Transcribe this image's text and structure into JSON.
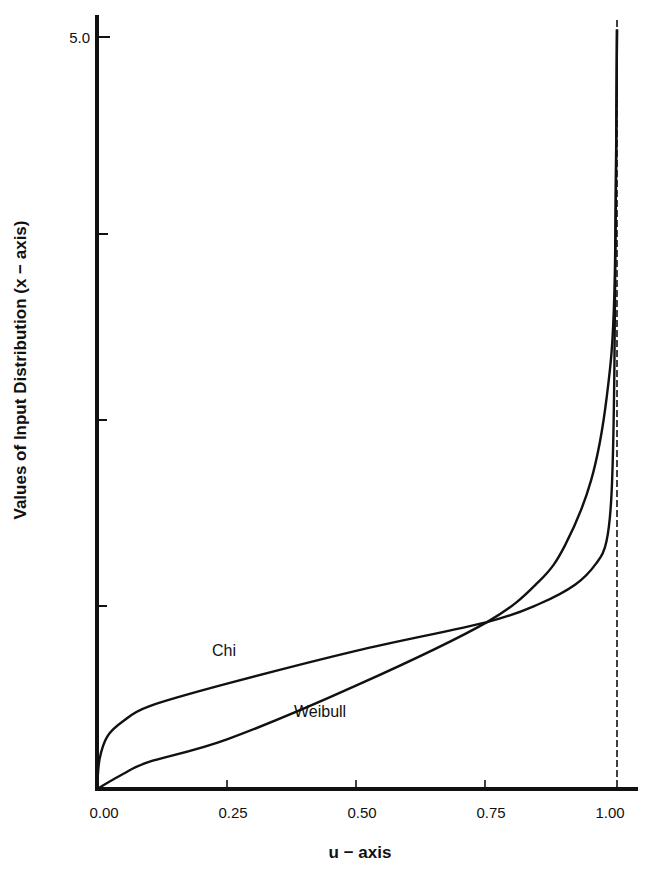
{
  "chart_data": {
    "type": "line",
    "title": "",
    "xlabel": "u − axis",
    "ylabel": "Values of Input Distribution (x − axis)",
    "xlim": [
      0.0,
      1.0
    ],
    "ylim": [
      0.0,
      5.0
    ],
    "grid": false,
    "legend": "inline labels on curves",
    "x_ticks": [
      {
        "value": 0.0,
        "label": "0.00"
      },
      {
        "value": 0.25,
        "label": "0.25"
      },
      {
        "value": 0.5,
        "label": "0.50"
      },
      {
        "value": 0.75,
        "label": "0.75"
      },
      {
        "value": 1.0,
        "label": "1.00"
      }
    ],
    "y_ticks": [
      {
        "value": 1.25,
        "label": ""
      },
      {
        "value": 2.5,
        "label": ""
      },
      {
        "value": 3.75,
        "label": ""
      },
      {
        "value": 5.0,
        "label": "5.0"
      }
    ],
    "annotations": [
      {
        "type": "vertical-dashed-line",
        "x": 1.0,
        "meaning": "asymptote at u = 1.00"
      },
      {
        "type": "curve-intersection",
        "x": 0.75,
        "y": 1.11
      }
    ],
    "series": [
      {
        "name": "Chi",
        "label_pos": {
          "u": 0.22,
          "v": 1.0
        },
        "x": [
          0.0,
          0.005,
          0.02,
          0.05,
          0.1,
          0.25,
          0.5,
          0.75,
          0.85,
          0.92,
          0.96,
          0.98,
          0.99,
          0.995,
          1.0
        ],
        "y": [
          0.0,
          0.2,
          0.35,
          0.45,
          0.55,
          0.7,
          0.92,
          1.11,
          1.23,
          1.36,
          1.5,
          1.65,
          2.0,
          2.8,
          5.05
        ]
      },
      {
        "name": "Weibull",
        "label_pos": {
          "u": 0.38,
          "v": 0.18
        },
        "x": [
          0.0,
          0.05,
          0.1,
          0.25,
          0.5,
          0.75,
          0.85,
          0.9,
          0.95,
          0.98,
          0.995,
          1.0
        ],
        "y": [
          0.0,
          0.1,
          0.18,
          0.33,
          0.69,
          1.11,
          1.38,
          1.62,
          2.05,
          2.6,
          3.3,
          5.05
        ]
      }
    ]
  },
  "labels": {
    "xlabel": "u − axis",
    "ylabel": "Values of Input Distribution (x − axis)",
    "chi": "Chi",
    "weibull": "Weibull",
    "y_top": "5.0",
    "x0": "0.00",
    "x1": "0.25",
    "x2": "0.50",
    "x3": "0.75",
    "x4": "1.00"
  },
  "colors": {
    "ink": "#111111",
    "background": "#ffffff"
  }
}
